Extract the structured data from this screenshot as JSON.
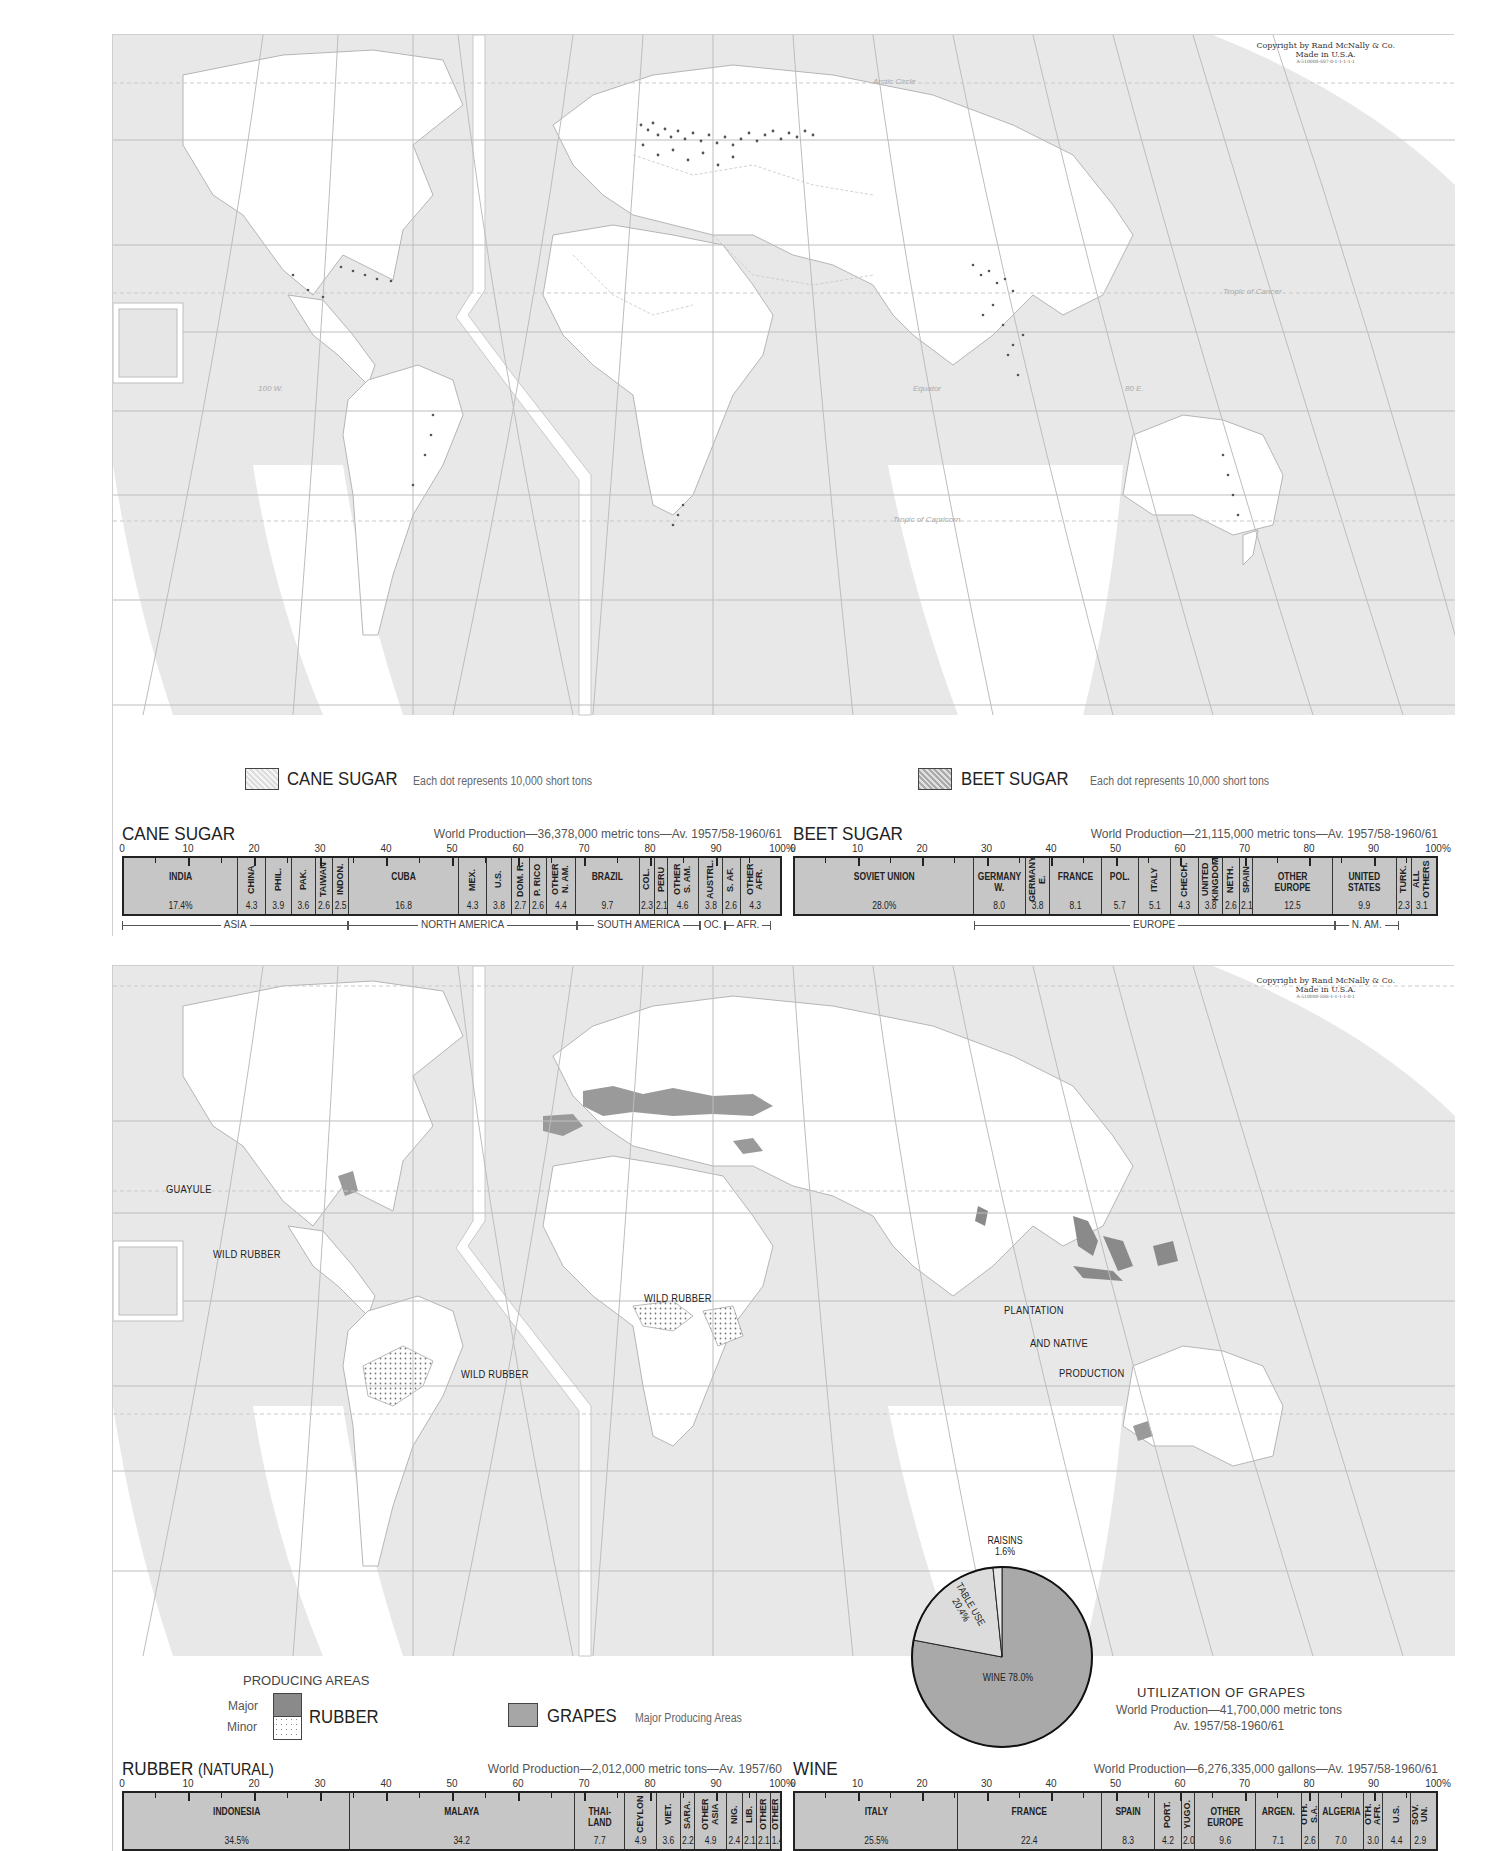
{
  "sugar_map": {
    "copyright": [
      "Copyright by Rand McNally & Co.",
      "Made in U.S.A.",
      "A-510000-S87-0-1-1-1-1-1"
    ],
    "grid_labels": {
      "arctic": "Arctic Circle",
      "tropic_cancer": "Tropic of Cancer",
      "equator": "Equator",
      "tropic_capricorn": "Tropic of Capricorn",
      "lon_100w": "100 W.",
      "lon_80e": "80 E.",
      "lon_120": "120",
      "lon_140": "140",
      "lon_160": "160",
      "lon_60": "60",
      "lon_40": "40",
      "lat_60": "60",
      "lat_40": "40",
      "lat_20": "20",
      "lat_0": "0"
    },
    "legend": {
      "cane": {
        "title": "CANE SUGAR",
        "note": "Each dot represents 10,000 short tons"
      },
      "beet": {
        "title": "BEET SUGAR",
        "note": "Each dot represents 10,000 short tons"
      }
    }
  },
  "rubber_map": {
    "copyright": [
      "Copyright by Rand McNally & Co.",
      "Made in U.S.A.",
      "A-510000-S88-1-1-1-1-0-1"
    ],
    "labels": {
      "guayule": "GUAYULE",
      "wild_rubber_1": "WILD RUBBER",
      "wild_rubber_2": "WILD RUBBER",
      "wild_rubber_3": "WILD RUBBER",
      "plantation_1": "PLANTATION",
      "plantation_2": "AND NATIVE",
      "plantation_3": "PRODUCTION"
    },
    "legend": {
      "producing_title": "PRODUCING AREAS",
      "major": "Major",
      "minor": "Minor",
      "rubber": "RUBBER",
      "grapes": "GRAPES",
      "grapes_note": "Major Producing Areas"
    },
    "utilization": {
      "title": "UTILIZATION OF GRAPES",
      "line1": "World Production—41,700,000 metric tons",
      "line2": "Av. 1957/58-1960/61",
      "raisins": "RAISINS",
      "raisins_pct": "1.6%",
      "table": "TABLE USE",
      "table_pct": "20.4%",
      "wine": "WINE 78.0%"
    }
  },
  "chart_data": [
    {
      "type": "bar",
      "title": "CANE SUGAR",
      "subtitle": "World Production—36,378,000 metric tons—Av. 1957/58-1960/61",
      "xlabel": "",
      "ylabel": "",
      "axis_ticks": [
        "0",
        "10",
        "20",
        "30",
        "40",
        "50",
        "60",
        "70",
        "80",
        "90",
        "100%"
      ],
      "categories": [
        "INDIA",
        "CHINA",
        "PHIL.",
        "PAK.",
        "TAIWAN",
        "INDON.",
        "CUBA",
        "MEX.",
        "U.S.",
        "DOM. R.",
        "P. RICO",
        "OTHER N. AM.",
        "BRAZIL",
        "COL.",
        "PERU",
        "OTHER S. AM.",
        "AUSTRL.",
        "S. AF.",
        "OTHER AFR."
      ],
      "values": [
        17.4,
        4.3,
        3.9,
        3.6,
        2.6,
        2.5,
        16.8,
        4.3,
        3.8,
        2.7,
        2.6,
        4.4,
        9.7,
        2.3,
        2.1,
        4.6,
        3.8,
        2.6,
        4.3
      ],
      "value_labels": [
        "17.4%",
        "4.3",
        "3.9",
        "3.6",
        "2.6",
        "2.5",
        "16.8",
        "4.3",
        "3.8",
        "2.7",
        "2.6",
        "4.4",
        "9.7",
        "2.3",
        "2.1",
        "4.6",
        "3.8",
        "2.6",
        "4.3"
      ],
      "regions": [
        {
          "name": "ASIA",
          "start": 0,
          "end": 34.3
        },
        {
          "name": "NORTH AMERICA",
          "start": 34.3,
          "end": 68.9
        },
        {
          "name": "SOUTH AMERICA",
          "start": 68.9,
          "end": 87.6
        },
        {
          "name": "OC.",
          "start": 87.6,
          "end": 91.4
        },
        {
          "name": "AFR.",
          "start": 91.4,
          "end": 98.3
        }
      ],
      "xlim": [
        0,
        100
      ]
    },
    {
      "type": "bar",
      "title": "BEET SUGAR",
      "subtitle": "World Production—21,115,000 metric tons—Av. 1957/58-1960/61",
      "xlabel": "",
      "ylabel": "",
      "axis_ticks": [
        "0",
        "10",
        "20",
        "30",
        "40",
        "50",
        "60",
        "70",
        "80",
        "90",
        "100%"
      ],
      "categories": [
        "SOVIET UNION",
        "GERMANY W.",
        "GERMANY E.",
        "FRANCE",
        "POL.",
        "ITALY",
        "CHECH.",
        "UNITED KINGDOM",
        "NETH.",
        "SPAIN",
        "OTHER EUROPE",
        "UNITED STATES",
        "TURK.",
        "ALL OTHERS"
      ],
      "values": [
        28.0,
        8.0,
        3.8,
        8.1,
        5.7,
        5.1,
        4.3,
        3.8,
        2.6,
        2.1,
        12.5,
        9.9,
        2.3,
        3.1
      ],
      "value_labels": [
        "28.0%",
        "8.0",
        "3.8",
        "8.1",
        "5.7",
        "5.1",
        "4.3",
        "3.8",
        "2.6",
        "2.1",
        "12.5",
        "9.9",
        "2.3",
        "3.1"
      ],
      "regions": [
        {
          "name": "EUROPE",
          "start": 28.0,
          "end": 84.0
        },
        {
          "name": "N. AM.",
          "start": 84.0,
          "end": 93.9
        }
      ],
      "xlim": [
        0,
        100
      ]
    },
    {
      "type": "bar",
      "title": "RUBBER",
      "title_suffix": "(NATURAL)",
      "subtitle": "World Production—2,012,000 metric tons—Av. 1957/60",
      "xlabel": "",
      "ylabel": "",
      "axis_ticks": [
        "0",
        "10",
        "20",
        "30",
        "40",
        "50",
        "60",
        "70",
        "80",
        "90",
        "100%"
      ],
      "categories": [
        "INDONESIA",
        "MALAYA",
        "THAI-LAND",
        "CEYLON",
        "VIET.",
        "SARA.",
        "OTHER ASIA",
        "NIG.",
        "LIB.",
        "OTHER",
        "OTHER"
      ],
      "values": [
        34.5,
        34.2,
        7.7,
        4.9,
        3.6,
        2.2,
        4.9,
        2.4,
        2.1,
        2.1,
        1.4
      ],
      "value_labels": [
        "34.5%",
        "34.2",
        "7.7",
        "4.9",
        "3.6",
        "2.2",
        "4.9",
        "2.4",
        "2.1",
        "2.1",
        "1.4"
      ],
      "xlim": [
        0,
        100
      ]
    },
    {
      "type": "bar",
      "title": "WINE",
      "subtitle": "World Production—6,276,335,000 gallons—Av. 1957/58-1960/61",
      "xlabel": "",
      "ylabel": "",
      "axis_ticks": [
        "0",
        "10",
        "20",
        "30",
        "40",
        "50",
        "60",
        "70",
        "80",
        "90",
        "100%"
      ],
      "categories": [
        "ITALY",
        "FRANCE",
        "SPAIN",
        "PORT.",
        "YUGO.",
        "OTHER EUROPE",
        "ARGEN.",
        "OTH. S.A.",
        "ALGERIA",
        "OTH. AFR.",
        "U.S.",
        "SOV. UN."
      ],
      "values": [
        25.5,
        22.4,
        8.3,
        4.2,
        2.0,
        9.6,
        7.1,
        2.6,
        7.0,
        3.0,
        4.4,
        2.9
      ],
      "value_labels": [
        "25.5%",
        "22.4",
        "8.3",
        "4.2",
        "2.0",
        "9.6",
        "7.1",
        "2.6",
        "7.0",
        "3.0",
        "4.4",
        "2.9"
      ],
      "xlim": [
        0,
        100
      ]
    },
    {
      "type": "pie",
      "title": "UTILIZATION OF GRAPES",
      "subtitle": "World Production—41,700,000 metric tons Av. 1957/58-1960/61",
      "categories": [
        "WINE",
        "TABLE USE",
        "RAISINS"
      ],
      "values": [
        78.0,
        20.4,
        1.6
      ]
    }
  ]
}
